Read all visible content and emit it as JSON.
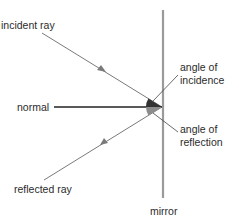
{
  "diagram": {
    "labels": {
      "incident_ray": "incident ray",
      "normal": "normal",
      "reflected_ray": "reflected ray",
      "mirror": "mirror",
      "angle_of_incidence_line1": "angle of",
      "angle_of_incidence_line2": "incidence",
      "angle_of_reflection_line1": "angle of",
      "angle_of_reflection_line2": "reflection"
    },
    "colors": {
      "ray": "#7a7a7a",
      "mirror": "#9a9a9a",
      "normal": "#222222",
      "incidence_wedge": "#333333",
      "reflection_wedge": "#8c8c8c",
      "text": "#2b2b2b"
    }
  }
}
